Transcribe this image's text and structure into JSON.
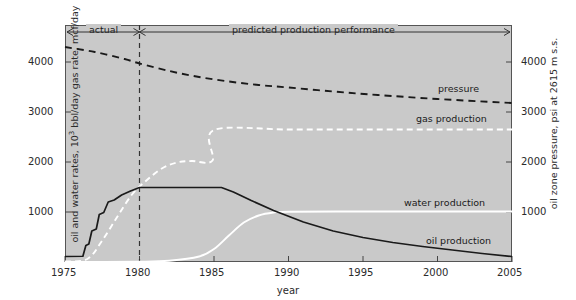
{
  "chart_data": {
    "type": "line",
    "title": "",
    "xlabel": "year",
    "ylabel_left": "oil and water rates, 10³ bbl/day  gas rate, mcf/day",
    "ylabel_right": "oil zone pressure, psi at 2615 m s.s.",
    "xlim": [
      1975,
      2005
    ],
    "ylim": [
      0,
      4500
    ],
    "grid": false,
    "legend_position": "inline-annotations",
    "xticks": [
      "1975",
      "1980",
      "1985",
      "1990",
      "1995",
      "2000",
      "2005"
    ],
    "yticks_left": [
      "1000",
      "2000",
      "3000",
      "4000"
    ],
    "yticks_right": [
      "1000",
      "2000",
      "3000",
      "4000"
    ],
    "annotations": [
      {
        "text": "actual",
        "x_range": [
          1975,
          1980
        ]
      },
      {
        "text": "predicted production performance",
        "x_range": [
          1980,
          2005
        ]
      }
    ],
    "divider_year": 1980,
    "series": [
      {
        "name": "pressure",
        "style": "dashed",
        "color": "#1a1a1a",
        "axis": "right",
        "unit": "psi",
        "points": [
          [
            1975,
            4300
          ],
          [
            1977,
            4200
          ],
          [
            1979,
            4060
          ],
          [
            1980,
            3970
          ],
          [
            1982,
            3820
          ],
          [
            1984,
            3700
          ],
          [
            1986,
            3610
          ],
          [
            1988,
            3540
          ],
          [
            1990,
            3490
          ],
          [
            1993,
            3410
          ],
          [
            1996,
            3340
          ],
          [
            2000,
            3260
          ],
          [
            2005,
            3180
          ]
        ]
      },
      {
        "name": "gas production",
        "style": "dashed",
        "color": "#ffffff",
        "axis": "left",
        "unit": "mcf/day",
        "points": [
          [
            1975,
            10
          ],
          [
            1976.5,
            60
          ],
          [
            1977.5,
            430
          ],
          [
            1978.5,
            900
          ],
          [
            1979.5,
            1350
          ],
          [
            1980.5,
            1640
          ],
          [
            1981.5,
            1870
          ],
          [
            1982.5,
            1990
          ],
          [
            1983.5,
            2020
          ],
          [
            1984.9,
            2030
          ],
          [
            1985.0,
            2640
          ],
          [
            1990,
            2650
          ],
          [
            1995,
            2650
          ],
          [
            2000,
            2650
          ],
          [
            2005,
            2650
          ]
        ]
      },
      {
        "name": "water production",
        "style": "solid",
        "color": "#ffffff",
        "axis": "left",
        "unit": "10³ bbl/day",
        "points": [
          [
            1975,
            0
          ],
          [
            1980,
            5
          ],
          [
            1982,
            25
          ],
          [
            1984,
            110
          ],
          [
            1985,
            260
          ],
          [
            1986,
            530
          ],
          [
            1987,
            790
          ],
          [
            1988,
            930
          ],
          [
            1989,
            990
          ],
          [
            1990,
            1005
          ],
          [
            1995,
            1010
          ],
          [
            2000,
            1010
          ],
          [
            2005,
            1010
          ]
        ]
      },
      {
        "name": "oil production",
        "style": "solid",
        "color": "#1a1a1a",
        "axis": "left",
        "unit": "10³ bbl/day",
        "points": [
          [
            1975,
            110
          ],
          [
            1976.2,
            115
          ],
          [
            1976.4,
            330
          ],
          [
            1976.6,
            360
          ],
          [
            1976.8,
            620
          ],
          [
            1977.1,
            660
          ],
          [
            1977.3,
            950
          ],
          [
            1977.6,
            990
          ],
          [
            1977.9,
            1200
          ],
          [
            1978.3,
            1240
          ],
          [
            1978.8,
            1340
          ],
          [
            1979.4,
            1420
          ],
          [
            1980,
            1490
          ],
          [
            1985.5,
            1490
          ],
          [
            1986.3,
            1400
          ],
          [
            1987.5,
            1230
          ],
          [
            1989,
            1030
          ],
          [
            1991,
            800
          ],
          [
            1993,
            620
          ],
          [
            1995,
            490
          ],
          [
            1997,
            390
          ],
          [
            1999,
            310
          ],
          [
            2001,
            240
          ],
          [
            2003,
            170
          ],
          [
            2005,
            110
          ]
        ]
      }
    ]
  },
  "labels": {
    "pressure": "pressure",
    "gas_production": "gas production",
    "water_production": "water production",
    "oil_production": "oil production",
    "actual": "actual",
    "predicted": "predicted production performance",
    "xaxis": "year",
    "yaxis_left_part1": "oil and water rates, 10",
    "yaxis_left_sup": "3",
    "yaxis_left_part2": " bbl/day  gas rate, mcf/day",
    "yaxis_right": "oil zone pressure, psi at 2615 m s.s."
  },
  "ticks": {
    "x": [
      "1975",
      "1980",
      "1985",
      "1990",
      "1995",
      "2000",
      "2005"
    ],
    "y_left": [
      "4000",
      "3000",
      "2000",
      "1000"
    ],
    "y_right": [
      "4000",
      "3000",
      "2000",
      "1000"
    ]
  },
  "colors": {
    "plot_background": "#c9c9c9",
    "page_background": "#ffffff",
    "dark_curve": "#1a1a1a",
    "light_curve": "#ffffff",
    "axis": "#555555",
    "text": "#2b2b2b"
  }
}
